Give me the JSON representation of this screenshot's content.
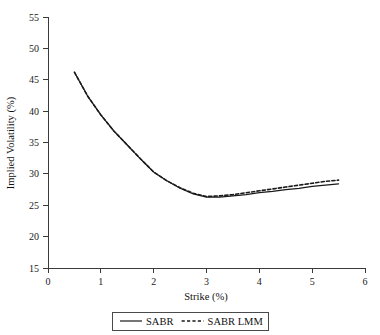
{
  "chart_data": {
    "type": "line",
    "title": "",
    "xlabel": "Strike (%)",
    "ylabel": "Implied Volatility (%)",
    "xlim": [
      0,
      6
    ],
    "ylim": [
      15,
      55
    ],
    "xticks": [
      0,
      1,
      2,
      3,
      4,
      5,
      6
    ],
    "xtick_labels": [
      "0",
      "1",
      "2",
      "3",
      "4",
      "5",
      "6"
    ],
    "yticks": [
      15,
      20,
      25,
      30,
      35,
      40,
      45,
      50,
      55
    ],
    "ytick_labels": [
      "15",
      "20",
      "25",
      "30",
      "35",
      "40",
      "45",
      "50",
      "55"
    ],
    "grid": false,
    "legend_position": "below-axes",
    "x": [
      0.5,
      0.75,
      1.0,
      1.25,
      1.5,
      1.75,
      2.0,
      2.25,
      2.5,
      2.75,
      3.0,
      3.25,
      3.5,
      3.75,
      4.0,
      4.25,
      4.5,
      4.75,
      5.0,
      5.25,
      5.5
    ],
    "series": [
      {
        "name": "SABR",
        "style": "solid",
        "color": "#1a1a1a",
        "values": [
          46.2,
          42.4,
          39.4,
          36.8,
          34.6,
          32.4,
          30.3,
          28.9,
          27.7,
          26.8,
          26.3,
          26.3,
          26.5,
          26.7,
          27.0,
          27.2,
          27.5,
          27.7,
          28.0,
          28.2,
          28.4
        ]
      },
      {
        "name": "SABR LMM",
        "style": "dashed",
        "color": "#1a1a1a",
        "values": [
          46.2,
          42.4,
          39.4,
          36.8,
          34.6,
          32.4,
          30.3,
          28.9,
          27.8,
          26.9,
          26.4,
          26.5,
          26.7,
          27.0,
          27.3,
          27.6,
          27.9,
          28.2,
          28.5,
          28.8,
          29.0
        ]
      }
    ],
    "legend": [
      {
        "label": "SABR",
        "style": "solid"
      },
      {
        "label": "SABR LMM",
        "style": "dashed"
      }
    ]
  },
  "colors": {
    "axis": "#3a3a3a",
    "text": "#1a1a1a",
    "background": "#ffffff",
    "series": "#1a1a1a"
  }
}
